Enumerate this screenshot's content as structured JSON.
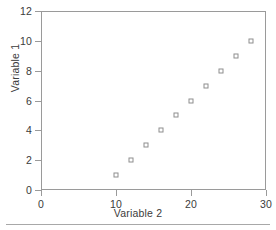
{
  "chart_data": {
    "type": "scatter",
    "title": "",
    "xlabel": "Variable 2",
    "ylabel": "Variable 1",
    "x": [
      10,
      12,
      14,
      16,
      18,
      20,
      22,
      24,
      26,
      28
    ],
    "y": [
      1,
      2,
      3,
      4,
      5,
      6,
      7,
      8,
      9,
      10
    ],
    "points": [
      {
        "x": 10,
        "y": 1
      },
      {
        "x": 12,
        "y": 2
      },
      {
        "x": 14,
        "y": 3
      },
      {
        "x": 16,
        "y": 4
      },
      {
        "x": 18,
        "y": 5
      },
      {
        "x": 20,
        "y": 6
      },
      {
        "x": 22,
        "y": 7
      },
      {
        "x": 24,
        "y": 8
      },
      {
        "x": 26,
        "y": 9
      },
      {
        "x": 28,
        "y": 10
      }
    ],
    "xlim": [
      0,
      30
    ],
    "ylim": [
      0,
      12
    ],
    "xticks": [
      0,
      10,
      20,
      30
    ],
    "yticks": [
      0,
      2,
      4,
      6,
      8,
      10,
      12
    ],
    "xtick_labels": [
      "0",
      "10",
      "20",
      "30"
    ],
    "ytick_labels": [
      "0",
      "2",
      "4",
      "6",
      "8",
      "10",
      "12"
    ],
    "grid": false,
    "legend": null,
    "marker": "open-square",
    "marker_color": "#8e8e8e",
    "axis_color": "#9a9a9a",
    "text_color": "#3b3b3b",
    "background": "#ffffff"
  }
}
